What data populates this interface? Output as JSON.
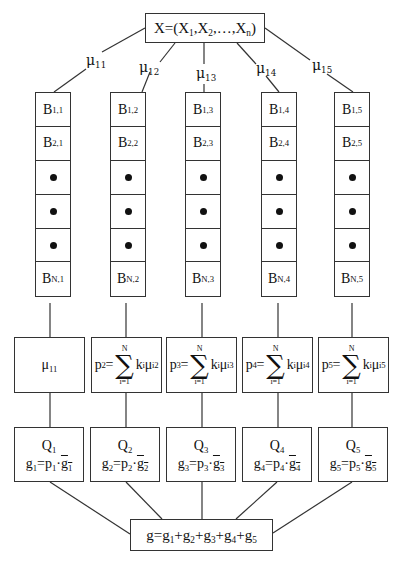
{
  "diagram": {
    "input": {
      "label": "X=(X",
      "sub1": "1",
      "sep1": ",X",
      "sub2": "2",
      "sep2": ",…,X",
      "subn": "n",
      "close": ")"
    },
    "weights": [
      {
        "base": "μ",
        "sub": "11"
      },
      {
        "base": "μ",
        "sub": "12"
      },
      {
        "base": "μ",
        "sub": "13"
      },
      {
        "base": "μ",
        "sub": "14"
      },
      {
        "base": "μ",
        "sub": "15"
      }
    ],
    "columns": [
      {
        "cells": [
          {
            "b": "B",
            "sub": "1,1"
          },
          {
            "b": "B",
            "sub": "2,1"
          },
          {
            "dot": true
          },
          {
            "dot": true
          },
          {
            "dot": true
          },
          {
            "b": "B",
            "sub": "N,1"
          }
        ],
        "p": {
          "simple": "μ",
          "simple_sub": "11"
        },
        "q": {
          "name": "Q",
          "name_sub": "1",
          "g": "g",
          "g_sub": "1",
          "eq": "=p",
          "p_sub": "1",
          "dot": "·",
          "gbar": "g",
          "gbar_sub": "1"
        }
      },
      {
        "cells": [
          {
            "b": "B",
            "sub": "1,2"
          },
          {
            "b": "B",
            "sub": "2,2"
          },
          {
            "dot": true
          },
          {
            "dot": true
          },
          {
            "dot": true
          },
          {
            "b": "B",
            "sub": "N,2"
          }
        ],
        "p": {
          "lhs": "p",
          "lhs_sub": "2",
          "eq": "=",
          "upper": "N",
          "lower": "i=1",
          "term": "k",
          "term_sub": "i",
          "mu": "μ",
          "mu_sub": "i2"
        },
        "q": {
          "name": "Q",
          "name_sub": "2",
          "g": "g",
          "g_sub": "2",
          "eq": "=p",
          "p_sub": "2",
          "dot": "·",
          "gbar": "g",
          "gbar_sub": "2"
        }
      },
      {
        "cells": [
          {
            "b": "B",
            "sub": "1,3"
          },
          {
            "b": "B",
            "sub": "2,3"
          },
          {
            "dot": true
          },
          {
            "dot": true
          },
          {
            "dot": true
          },
          {
            "b": "B",
            "sub": "N,3"
          }
        ],
        "p": {
          "lhs": "p",
          "lhs_sub": "3",
          "eq": "=",
          "upper": "N",
          "lower": "i=1",
          "term": "k",
          "term_sub": "i",
          "mu": "μ",
          "mu_sub": "i3"
        },
        "q": {
          "name": "Q",
          "name_sub": "3",
          "g": "g",
          "g_sub": "3",
          "eq": "=p",
          "p_sub": "3",
          "dot": "·",
          "gbar": "g",
          "gbar_sub": "3"
        }
      },
      {
        "cells": [
          {
            "b": "B",
            "sub": "1,4"
          },
          {
            "b": "B",
            "sub": "2,4"
          },
          {
            "dot": true
          },
          {
            "dot": true
          },
          {
            "dot": true
          },
          {
            "b": "B",
            "sub": "N,4"
          }
        ],
        "p": {
          "lhs": "p",
          "lhs_sub": "4",
          "eq": "=",
          "upper": "N",
          "lower": "i=1",
          "term": "k",
          "term_sub": "i",
          "mu": "μ",
          "mu_sub": "i4"
        },
        "q": {
          "name": "Q",
          "name_sub": "4",
          "g": "g",
          "g_sub": "4",
          "eq": "=p",
          "p_sub": "4",
          "dot": "·",
          "gbar": "g",
          "gbar_sub": "4"
        }
      },
      {
        "cells": [
          {
            "b": "B",
            "sub": "1,5"
          },
          {
            "b": "B",
            "sub": "2,5"
          },
          {
            "dot": true
          },
          {
            "dot": true
          },
          {
            "dot": true
          },
          {
            "b": "B",
            "sub": "N,5"
          }
        ],
        "p": {
          "lhs": "p",
          "lhs_sub": "5",
          "eq": "=",
          "upper": "N",
          "lower": "i=1",
          "term": "k",
          "term_sub": "i",
          "mu": "μ",
          "mu_sub": "i5"
        },
        "q": {
          "name": "Q",
          "name_sub": "5",
          "g": "g",
          "g_sub": "5",
          "eq": "=p",
          "p_sub": "5",
          "dot": "·",
          "gbar": "g",
          "gbar_sub": "5"
        }
      }
    ],
    "output": {
      "lhs": "g=",
      "terms": [
        {
          "b": "g",
          "sub": "1"
        },
        {
          "b": "g",
          "sub": "2"
        },
        {
          "b": "g",
          "sub": "3"
        },
        {
          "b": "g",
          "sub": "4"
        },
        {
          "b": "g",
          "sub": "5"
        }
      ],
      "plus": "+"
    },
    "colors": {
      "line": "#333333",
      "text": "#111111",
      "background": "#ffffff"
    }
  }
}
